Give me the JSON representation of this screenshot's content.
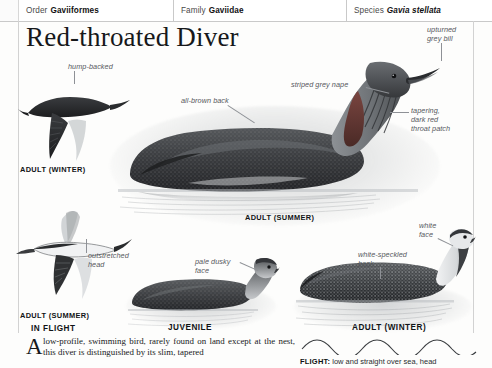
{
  "taxonomy": {
    "order": {
      "key": "Order",
      "value": "Gaviiformes"
    },
    "family": {
      "key": "Family",
      "value": "Gaviidae"
    },
    "species": {
      "key": "Species",
      "value": "Gavia stellata"
    }
  },
  "title": "Red-throated Diver",
  "annotations": {
    "hump_backed": "hump-backed",
    "all_brown_back": "all-brown back",
    "striped_grey_nape": "striped grey nape",
    "upturned_grey_bill": "upturned\ngrey bill",
    "upturned_grey_bill_l1": "upturned",
    "upturned_grey_bill_l2": "grey bill",
    "throat_patch_l1": "tapering,",
    "throat_patch_l2": "dark red",
    "throat_patch_l3": "throat patch",
    "outstretched_head_l1": "outstretched",
    "outstretched_head_l2": "head",
    "pale_dusky_face_l1": "pale dusky",
    "pale_dusky_face_l2": "face",
    "white_face_l1": "white",
    "white_face_l2": "face",
    "white_speckled_back_l1": "white-speckled",
    "white_speckled_back_l2": "back"
  },
  "captions": {
    "adult_winter_flight": "ADULT (WINTER)",
    "adult_summer_flight": "ADULT (SUMMER)",
    "in_flight": "IN FLIGHT",
    "adult_summer_swim": "ADULT (SUMMER)",
    "juvenile": "JUVENILE",
    "adult_winter_swim": "ADULT (WINTER)"
  },
  "footer": {
    "dropcap": "A",
    "body": "low-profile, swimming bird, rarely found on land except at the nest, this diver is distinguished by its slim, tapered",
    "flight_label": "FLIGHT:",
    "flight_text": "low and straight over sea, head"
  },
  "colors": {
    "page_bg": "#fdfdfc",
    "rule": "#d2d2d2",
    "header_border": "#c9c9c9",
    "annotation_text": "#55585c",
    "leader_line": "#8e9196",
    "caption_text": "#111416",
    "title_text": "#16181a",
    "bird_dark": "#2b2b2d",
    "bird_mid": "#6c6f73",
    "bird_light": "#c8cacc",
    "throat_red": "#6b3a33",
    "water": "#9aa0a6"
  }
}
